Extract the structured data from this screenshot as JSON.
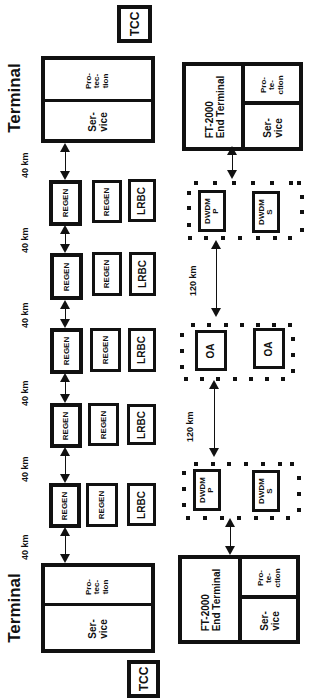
{
  "diagram": {
    "orientation": "rotated -90deg (text reads bottom-to-top)",
    "left_system": {
      "top_tcc": {
        "label": "TCC"
      },
      "top_terminal": {
        "title": "Terminal",
        "protection": "Pro-\ntec-\ntion",
        "service": "Ser-\nvice"
      },
      "bottom_terminal": {
        "title": "Terminal",
        "protection": "Pro-\ntec-\ntion",
        "service": "Ser-\nvice"
      },
      "bottom_tcc": {
        "label": "TCC"
      },
      "spans": [
        "40 km",
        "40 km",
        "40 km",
        "40 km",
        "40 km",
        "40 km"
      ],
      "sites": [
        {
          "regen_a": "REGEN",
          "regen_b": "REGEN",
          "lrbc": "LRBC"
        },
        {
          "regen_a": "REGEN",
          "regen_b": "REGEN",
          "lrbc": "LRBC"
        },
        {
          "regen_a": "REGEN",
          "regen_b": "REGEN",
          "lrbc": "LRBC"
        },
        {
          "regen_a": "REGEN",
          "regen_b": "REGEN",
          "lrbc": "LRBC"
        },
        {
          "regen_a": "REGEN",
          "regen_b": "REGEN",
          "lrbc": "LRBC"
        }
      ]
    },
    "right_system": {
      "top_terminal": {
        "name": "FT-2000\nEnd Terminal",
        "protection": "Pro-\nte-\nction",
        "service": "Ser-\nvice"
      },
      "top_dwdm": {
        "p": "DWDM\nP",
        "s": "DWDM\nS"
      },
      "span_1": "120 km",
      "oa": {
        "a": "OA",
        "b": "OA"
      },
      "span_2": "120 km",
      "bottom_dwdm": {
        "p": "DWDM\nP",
        "s": "DWDM\nS"
      },
      "bottom_terminal": {
        "name": "FT-2000\nEnd Terminal",
        "protection": "Pro-\nte-\nction",
        "service": "Ser-\nvice"
      }
    }
  }
}
